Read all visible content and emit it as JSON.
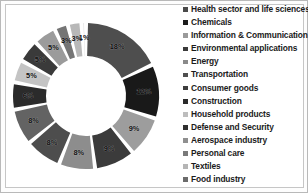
{
  "chart_data": {
    "type": "pie",
    "variant": "donut",
    "title": "",
    "subtitle": "",
    "xlabel": "",
    "ylabel": "",
    "grid": false,
    "legend_position": "right",
    "start_angle_deg": 0,
    "direction": "clockwise",
    "labels_shown": "percent",
    "categories": [
      "Health sector and life sciences",
      "Chemicals",
      "Information & Communication",
      "Environmental applications",
      "Energy",
      "Transportation",
      "Consumer goods",
      "Construction",
      "Household products",
      "Defense and Security",
      "Aerospace industry",
      "Personal care",
      "Textiles",
      "Food industry"
    ],
    "values": [
      18,
      12,
      9,
      9,
      8,
      8,
      8,
      6,
      5,
      5,
      5,
      3,
      3,
      1
    ],
    "value_labels": [
      "18%",
      "12%",
      "9%",
      "9%",
      "8%",
      "8%",
      "8%",
      "6%",
      "5%",
      "5%",
      "5%",
      "3%",
      "3%",
      "1%"
    ],
    "colors": [
      "#4a4a4a",
      "#1c1c1c",
      "#9a9a9a",
      "#3a3a3a",
      "#636363",
      "#707070",
      "#545454",
      "#3e3e3e",
      "#1f1f1f",
      "#c2c2c2",
      "#404040",
      "#9e9e9e",
      "#b0b0b0",
      "#7d7d7d",
      "#cfcfcf",
      "#e2e2e2"
    ]
  },
  "legend": {
    "items": [
      {
        "label": "Health sector and life sciences",
        "color": "#4a4a4a"
      },
      {
        "label": "Chemicals",
        "color": "#1c1c1c"
      },
      {
        "label": "Information & Communication",
        "color": "#9a9a9a"
      },
      {
        "label": "Environmental applications",
        "color": "#3a3a3a"
      },
      {
        "label": "Energy",
        "color": "#8a8a8a"
      },
      {
        "label": "Transportation",
        "color": "#4f4f4f"
      },
      {
        "label": "Consumer goods",
        "color": "#3d3d3d"
      },
      {
        "label": "Construction",
        "color": "#2a2a2a"
      },
      {
        "label": "Household products",
        "color": "#bdbdbd"
      },
      {
        "label": "Defense and Security",
        "color": "#2f2f2f"
      },
      {
        "label": "Aerospace industry",
        "color": "#8f8f8f"
      },
      {
        "label": "Personal care",
        "color": "#7a7a7a"
      },
      {
        "label": "Textiles",
        "color": "#b5b5b5"
      },
      {
        "label": "Food industry",
        "color": "#6b6b6b"
      }
    ]
  },
  "donut_geometry": {
    "cx": 85,
    "cy": 95,
    "outer_radius": 73,
    "inner_radius": 40,
    "gap_deg": 3.2,
    "label_radius": 58
  },
  "slice_styles": [
    {
      "fill": "#4e4e4e",
      "label": "18%"
    },
    {
      "fill": "#191919",
      "label": "12%"
    },
    {
      "fill": "#9d9d9d",
      "label": "9%"
    },
    {
      "fill": "#3b3b3b",
      "label": "9%"
    },
    {
      "fill": "#8d8d8d",
      "label": "8%"
    },
    {
      "fill": "#4d4d4d",
      "label": "8%"
    },
    {
      "fill": "#636363",
      "label": "8%"
    },
    {
      "fill": "#2b2b2b",
      "label": "6%"
    },
    {
      "fill": "#c4c4c4",
      "label": "5%"
    },
    {
      "fill": "#3a3a3a",
      "label": "5%"
    },
    {
      "fill": "#9b9b9b",
      "label": "5%"
    },
    {
      "fill": "#757575",
      "label": "3%"
    },
    {
      "fill": "#b8b8b8",
      "label": "3%"
    },
    {
      "fill": "#d8d8d8",
      "label": "1%"
    }
  ]
}
